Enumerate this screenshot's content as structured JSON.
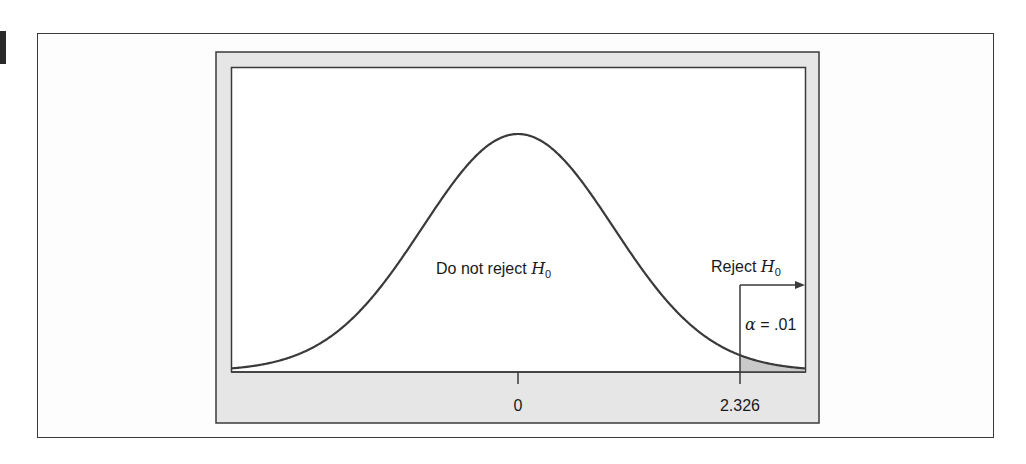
{
  "figure": {
    "marker_color": "#2a2a2a",
    "frame_fill": "#e6e6e6",
    "plot_fill": "#ffffff",
    "line_color": "#3a3a3a",
    "shade_color": "#c9c9c9"
  },
  "chart_data": {
    "type": "area",
    "title": "",
    "distribution": "standard normal",
    "mean": 0,
    "sd": 1,
    "xlim": [
      -3.0,
      3.0
    ],
    "x_ticks": [
      {
        "value": 0,
        "label": "0"
      },
      {
        "value": 2.326,
        "label": "2.326"
      }
    ],
    "critical_value": 2.326,
    "shaded_region": {
      "from": 2.326,
      "to": 3.0,
      "label": "α = .01",
      "alpha": 0.01
    },
    "annotations": [
      {
        "text": "Do not reject",
        "subscript_var": "H",
        "subscript": "0",
        "region": "x < 2.326"
      },
      {
        "text": "Reject",
        "subscript_var": "H",
        "subscript": "0",
        "region": "x > 2.326",
        "arrow": "right"
      }
    ],
    "xlabel": "",
    "ylabel": "",
    "grid": false,
    "legend": "none"
  },
  "labels": {
    "do_not_reject": "Do not reject ",
    "reject": "Reject ",
    "h_var": "H",
    "h_sub": "0",
    "alpha_sym": "α",
    "alpha_eq": " = .01",
    "tick_0": "0",
    "tick_crit": "2.326"
  }
}
